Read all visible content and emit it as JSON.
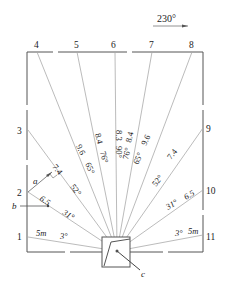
{
  "diagram": {
    "direction_label": "230°",
    "center": {
      "x": 117,
      "y": 251
    },
    "frame": {
      "x1": 27,
      "y1": 52,
      "x2": 203,
      "y2": 252
    },
    "small_box": {
      "x1": 102,
      "y1": 237,
      "x2": 130,
      "y2": 267
    },
    "markers": {
      "a": "a",
      "b": "b",
      "c": "c"
    },
    "lines": [
      {
        "id": "1",
        "end": [
          28,
          237
        ],
        "num_pos": [
          19,
          240
        ],
        "distance": "5m",
        "angle": "3°"
      },
      {
        "id": "2",
        "end": [
          28,
          192
        ],
        "num_pos": [
          19,
          196
        ],
        "distance": "6.5",
        "angle": "31°"
      },
      {
        "id": "3",
        "end": [
          28,
          130
        ],
        "num_pos": [
          19,
          134
        ],
        "distance": "7.4",
        "angle": "52°"
      },
      {
        "id": "4",
        "end": [
          37,
          52
        ],
        "num_pos": [
          37,
          47
        ],
        "distance": "9.6",
        "angle": "65°"
      },
      {
        "id": "5",
        "end": [
          77,
          52
        ],
        "num_pos": [
          77,
          47
        ],
        "distance": "8.4",
        "angle": "76°"
      },
      {
        "id": "6",
        "end": [
          115,
          52
        ],
        "num_pos": [
          114,
          47
        ],
        "distance": "8.3",
        "angle": "90°"
      },
      {
        "id": "7",
        "end": [
          152,
          52
        ],
        "num_pos": [
          152,
          47
        ],
        "distance": "8.4",
        "angle": "76°"
      },
      {
        "id": "8",
        "end": [
          192,
          52
        ],
        "num_pos": [
          192,
          47
        ],
        "distance": "9.6",
        "angle": "65°"
      },
      {
        "id": "9",
        "end": [
          203,
          128
        ],
        "num_pos": [
          207,
          132
        ],
        "distance": "7.4",
        "angle": "52°"
      },
      {
        "id": "10",
        "end": [
          203,
          190
        ],
        "num_pos": [
          207,
          194
        ],
        "distance": "6.5",
        "angle": "31°"
      },
      {
        "id": "11",
        "end": [
          203,
          235
        ],
        "num_pos": [
          207,
          239
        ],
        "distance": "5m",
        "angle": "3°"
      }
    ]
  }
}
